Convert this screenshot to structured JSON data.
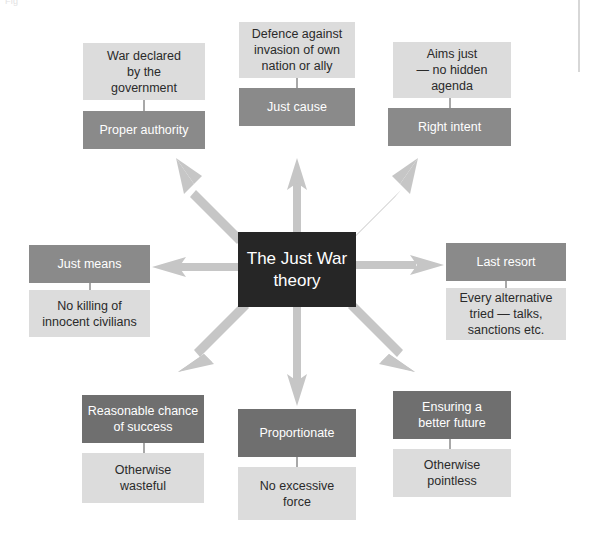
{
  "diagram": {
    "caption_ghost": "Fig",
    "center": {
      "label": "The Just War\ntheory",
      "line1": "The Just War",
      "line2": "theory",
      "color": "#262626"
    },
    "colors": {
      "dark_box": "#8a8a8a",
      "dark_box_strong": "#6f6f6f",
      "light_box": "#dcdcdc",
      "center_box": "#262626",
      "arrow": "#c6c6c6",
      "connector": "#a8a8a8",
      "dark_text": "#ffffff",
      "light_text": "#2a2a2a",
      "background": "#ffffff"
    },
    "branches": [
      {
        "id": "proper-authority",
        "position": "top-left",
        "criterion": "Proper authority",
        "detail": "War declared by the government",
        "detail_lines": [
          "War declared",
          "by the",
          "government"
        ],
        "criterion_lines": [
          "Proper authority"
        ],
        "detail_on_top": true
      },
      {
        "id": "just-cause",
        "position": "top-center",
        "criterion": "Just cause",
        "detail": "Defence against invasion of own nation or ally",
        "detail_lines": [
          "Defence against",
          "invasion of own",
          "nation or ally"
        ],
        "criterion_lines": [
          "Just cause"
        ],
        "detail_on_top": true
      },
      {
        "id": "right-intent",
        "position": "top-right",
        "criterion": "Right intent",
        "detail": "Aims just — no hidden agenda",
        "detail_lines": [
          "Aims just",
          "— no hidden",
          "agenda"
        ],
        "criterion_lines": [
          "Right intent"
        ],
        "detail_on_top": true
      },
      {
        "id": "just-means",
        "position": "left",
        "criterion": "Just means",
        "detail": "No killing of innocent civilians",
        "detail_lines": [
          "No killing of",
          "innocent civilians"
        ],
        "criterion_lines": [
          "Just means"
        ],
        "detail_on_top": false
      },
      {
        "id": "last-resort",
        "position": "right",
        "criterion": "Last resort",
        "detail": "Every alternative tried — talks, sanctions etc.",
        "detail_lines": [
          "Every alternative",
          "tried — talks,",
          "sanctions etc."
        ],
        "criterion_lines": [
          "Last resort"
        ],
        "detail_on_top": false
      },
      {
        "id": "reasonable-chance-of-success",
        "position": "bottom-left",
        "criterion": "Reasonable chance of success",
        "detail": "Otherwise wasteful",
        "detail_lines": [
          "Otherwise",
          "wasteful"
        ],
        "criterion_lines": [
          "Reasonable chance",
          "of success"
        ],
        "detail_on_top": false
      },
      {
        "id": "proportionate",
        "position": "bottom-center",
        "criterion": "Proportionate",
        "detail": "No excessive force",
        "detail_lines": [
          "No excessive",
          "force"
        ],
        "criterion_lines": [
          "Proportionate"
        ],
        "detail_on_top": false
      },
      {
        "id": "ensuring-a-better-future",
        "position": "bottom-right",
        "criterion": "Ensuring a better future",
        "detail": "Otherwise pointless",
        "detail_lines": [
          "Otherwise",
          "pointless"
        ],
        "criterion_lines": [
          "Ensuring a",
          "better future"
        ],
        "detail_on_top": false
      }
    ]
  }
}
